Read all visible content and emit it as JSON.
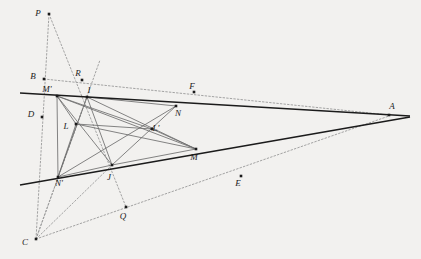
{
  "figure": {
    "background_color": "#f2f1ef",
    "ink_color": "#1b1b1b",
    "gray_color": "#6e6e6e",
    "light_color": "#9a9a9a",
    "width": 421,
    "height": 259,
    "points": [
      {
        "id": "P",
        "label": "P",
        "x": 49,
        "y": 14,
        "lx": 38,
        "ly": 14
      },
      {
        "id": "B",
        "label": "B",
        "x": 44,
        "y": 79,
        "lx": 33,
        "ly": 77
      },
      {
        "id": "R",
        "label": "R",
        "x": 82,
        "y": 80,
        "lx": 78,
        "ly": 74
      },
      {
        "id": "Mp",
        "label": "M'",
        "x": 57,
        "y": 96,
        "lx": 47,
        "ly": 90
      },
      {
        "id": "I",
        "label": "I",
        "x": 87,
        "y": 97,
        "lx": 89,
        "ly": 91
      },
      {
        "id": "F",
        "label": "F",
        "x": 194,
        "y": 92,
        "lx": 192,
        "ly": 87
      },
      {
        "id": "N",
        "label": "N",
        "x": 176,
        "y": 106,
        "lx": 178,
        "ly": 114
      },
      {
        "id": "A",
        "label": "A",
        "x": 389,
        "y": 115,
        "lx": 392,
        "ly": 107
      },
      {
        "id": "D",
        "label": "D",
        "x": 42,
        "y": 117,
        "lx": 31,
        "ly": 115
      },
      {
        "id": "L",
        "label": "L",
        "x": 76,
        "y": 124,
        "lx": 66,
        "ly": 127
      },
      {
        "id": "Lp",
        "label": "L'",
        "x": 152,
        "y": 129,
        "lx": 156,
        "ly": 129
      },
      {
        "id": "M",
        "label": "M",
        "x": 196,
        "y": 149,
        "lx": 194,
        "ly": 158
      },
      {
        "id": "J",
        "label": "J",
        "x": 112,
        "y": 165,
        "lx": 109,
        "ly": 178
      },
      {
        "id": "Np",
        "label": "N'",
        "x": 58,
        "y": 177,
        "lx": 59,
        "ly": 184
      },
      {
        "id": "E",
        "label": "E",
        "x": 241,
        "y": 176,
        "lx": 238,
        "ly": 184
      },
      {
        "id": "Q",
        "label": "Q",
        "x": 126,
        "y": 207,
        "lx": 123,
        "ly": 217
      },
      {
        "id": "C",
        "label": "C",
        "x": 36,
        "y": 239,
        "lx": 25,
        "ly": 243
      }
    ],
    "solid_lines": [
      {
        "name": "line-upper-ray-BA",
        "from": [
          20,
          93
        ],
        "to": [
          410,
          116
        ],
        "width": 1.6
      },
      {
        "name": "line-lower-ray-CA",
        "from": [
          20,
          185
        ],
        "to": [
          410,
          117
        ],
        "width": 1.6
      }
    ],
    "gray_lines": [
      {
        "name": "segment-Mprime-M",
        "from": [
          57,
          96
        ],
        "to": [
          196,
          149
        ]
      },
      {
        "name": "segment-Mprime-Lprime",
        "from": [
          57,
          96
        ],
        "to": [
          152,
          129
        ]
      },
      {
        "name": "segment-Mprime-J",
        "from": [
          57,
          96
        ],
        "to": [
          112,
          165
        ]
      },
      {
        "name": "segment-Mprime-Nprime",
        "from": [
          57,
          96
        ],
        "to": [
          58,
          177
        ]
      },
      {
        "name": "segment-I-N",
        "from": [
          87,
          97
        ],
        "to": [
          176,
          106
        ]
      },
      {
        "name": "segment-I-M",
        "from": [
          87,
          97
        ],
        "to": [
          196,
          149
        ]
      },
      {
        "name": "segment-I-Nprime",
        "from": [
          87,
          97
        ],
        "to": [
          58,
          177
        ]
      },
      {
        "name": "segment-I-J",
        "from": [
          87,
          97
        ],
        "to": [
          112,
          165
        ]
      },
      {
        "name": "segment-N-J",
        "from": [
          176,
          106
        ],
        "to": [
          112,
          165
        ]
      },
      {
        "name": "segment-N-Nprime",
        "from": [
          176,
          106
        ],
        "to": [
          58,
          177
        ]
      },
      {
        "name": "segment-L-M",
        "from": [
          76,
          124
        ],
        "to": [
          196,
          149
        ]
      },
      {
        "name": "segment-L-Lprime",
        "from": [
          76,
          124
        ],
        "to": [
          152,
          129
        ]
      },
      {
        "name": "segment-L-Nprime",
        "from": [
          76,
          124
        ],
        "to": [
          58,
          177
        ]
      },
      {
        "name": "segment-Mprime-L",
        "from": [
          57,
          96
        ],
        "to": [
          76,
          124
        ]
      },
      {
        "name": "segment-M-Lprime",
        "from": [
          196,
          149
        ],
        "to": [
          152,
          129
        ]
      },
      {
        "name": "segment-Nprime-J",
        "from": [
          58,
          177
        ],
        "to": [
          112,
          165
        ]
      },
      {
        "name": "segment-J-M",
        "from": [
          112,
          165
        ],
        "to": [
          196,
          149
        ]
      }
    ],
    "dotted_lines": [
      {
        "name": "dotted-P-to-C",
        "from": [
          49,
          14
        ],
        "to": [
          36,
          239
        ]
      },
      {
        "name": "dotted-P-to-Q",
        "from": [
          49,
          14
        ],
        "to": [
          126,
          207
        ]
      },
      {
        "name": "dotted-B-to-A",
        "from": [
          44,
          79
        ],
        "to": [
          389,
          115
        ]
      },
      {
        "name": "dotted-C-to-A",
        "from": [
          36,
          239
        ],
        "to": [
          389,
          116
        ]
      },
      {
        "name": "dotted-C-to-R",
        "from": [
          36,
          239
        ],
        "to": [
          87,
          97
        ]
      },
      {
        "name": "dotted-C-to-I",
        "from": [
          36,
          239
        ],
        "to": [
          100,
          60
        ]
      },
      {
        "name": "dotted-C-to-J",
        "from": [
          36,
          239
        ],
        "to": [
          112,
          165
        ]
      }
    ]
  }
}
